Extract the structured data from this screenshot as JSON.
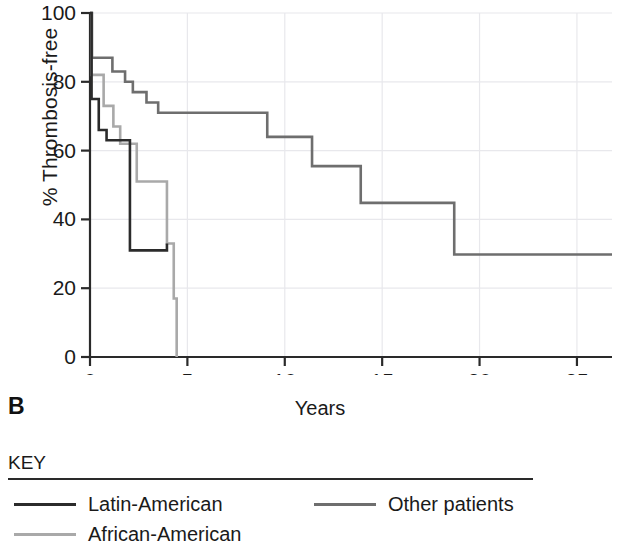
{
  "figure": {
    "panel_label": "B"
  },
  "chart_data": {
    "type": "line",
    "subtype": "kaplan-meier-step",
    "title": "",
    "xlabel": "Years",
    "ylabel": "% Thrombosis-free",
    "xlim": [
      0,
      26.8
    ],
    "ylim": [
      0,
      100
    ],
    "xticks": [
      0,
      5,
      10,
      15,
      20,
      25
    ],
    "xtick_labels": [
      "0",
      "5",
      "10",
      "15",
      "20",
      "25"
    ],
    "yticks": [
      0,
      20,
      40,
      60,
      80,
      100
    ],
    "ytick_labels": [
      "0",
      "20",
      "40",
      "60",
      "80",
      "100"
    ],
    "grid": true,
    "grid_color": "#e8e8ec",
    "legend_position": "below-plot",
    "series": [
      {
        "name": "Latin-American",
        "color": "#2b2b2b",
        "line_width": 2.6,
        "points": [
          [
            0,
            100
          ],
          [
            0.08,
            75
          ],
          [
            0.35,
            75
          ],
          [
            0.45,
            66
          ],
          [
            0.75,
            66
          ],
          [
            0.85,
            63
          ],
          [
            1.95,
            63
          ],
          [
            2.05,
            31
          ],
          [
            3.85,
            31
          ],
          [
            3.95,
            33
          ]
        ]
      },
      {
        "name": "Other patients",
        "color": "#6e6e6e",
        "line_width": 2.6,
        "points": [
          [
            0,
            100
          ],
          [
            0.1,
            87
          ],
          [
            1.05,
            87
          ],
          [
            1.15,
            83
          ],
          [
            1.7,
            83
          ],
          [
            1.8,
            80
          ],
          [
            2.1,
            80
          ],
          [
            2.2,
            77
          ],
          [
            2.8,
            77
          ],
          [
            2.9,
            74
          ],
          [
            3.4,
            74
          ],
          [
            3.5,
            71
          ],
          [
            9.0,
            71
          ],
          [
            9.1,
            64
          ],
          [
            11.3,
            64
          ],
          [
            11.4,
            55.5
          ],
          [
            13.8,
            55.5
          ],
          [
            13.9,
            44.8
          ],
          [
            18.6,
            44.8
          ],
          [
            18.7,
            29.8
          ],
          [
            26.8,
            29.8
          ]
        ]
      },
      {
        "name": "African-American",
        "color": "#a9a9a9",
        "line_width": 2.6,
        "points": [
          [
            0,
            100
          ],
          [
            0.07,
            82
          ],
          [
            0.6,
            82
          ],
          [
            0.7,
            73
          ],
          [
            1.1,
            73
          ],
          [
            1.2,
            67
          ],
          [
            1.45,
            67
          ],
          [
            1.55,
            62
          ],
          [
            2.3,
            62
          ],
          [
            2.4,
            51
          ],
          [
            3.85,
            51
          ],
          [
            3.95,
            33
          ],
          [
            4.2,
            33
          ],
          [
            4.3,
            17
          ],
          [
            4.4,
            17
          ],
          [
            4.45,
            0
          ]
        ]
      }
    ]
  },
  "key": {
    "title": "KEY",
    "entries": [
      {
        "label": "Latin-American",
        "color": "#2b2b2b"
      },
      {
        "label": "Other patients",
        "color": "#6e6e6e"
      },
      {
        "label": "African-American",
        "color": "#a9a9a9"
      }
    ]
  }
}
